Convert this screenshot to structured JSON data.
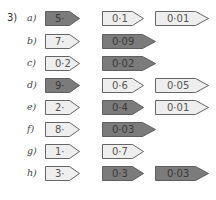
{
  "question": {
    "number": "3)"
  },
  "colors": {
    "dark_fill": "#7b7b7b",
    "light_fill": "#eeeeee",
    "stroke": "#555555"
  },
  "rows": [
    {
      "letter": "a)",
      "tags": [
        {
          "text": "5·",
          "shade": "dark"
        },
        {
          "text": "0·1",
          "shade": "light"
        },
        {
          "text": "0·01",
          "shade": "light"
        }
      ]
    },
    {
      "letter": "b)",
      "tags": [
        {
          "text": "7·",
          "shade": "light"
        },
        {
          "text": "0·09",
          "shade": "dark"
        }
      ]
    },
    {
      "letter": "c)",
      "tags": [
        {
          "text": "0·2",
          "shade": "light"
        },
        {
          "text": "0·02",
          "shade": "dark"
        }
      ]
    },
    {
      "letter": "d)",
      "tags": [
        {
          "text": "9·",
          "shade": "dark"
        },
        {
          "text": "0·6",
          "shade": "light"
        },
        {
          "text": "0·05",
          "shade": "light"
        }
      ]
    },
    {
      "letter": "e)",
      "tags": [
        {
          "text": "2·",
          "shade": "light"
        },
        {
          "text": "0·4",
          "shade": "dark"
        },
        {
          "text": "0·01",
          "shade": "light"
        }
      ]
    },
    {
      "letter": "f)",
      "tags": [
        {
          "text": "8·",
          "shade": "light"
        },
        {
          "text": "0·03",
          "shade": "dark"
        }
      ]
    },
    {
      "letter": "g)",
      "tags": [
        {
          "text": "1·",
          "shade": "light"
        },
        {
          "text": "0·7",
          "shade": "light"
        }
      ]
    },
    {
      "letter": "h)",
      "tags": [
        {
          "text": "3·",
          "shade": "light"
        },
        {
          "text": "0·3",
          "shade": "dark"
        },
        {
          "text": "0·03",
          "shade": "dark"
        }
      ]
    }
  ]
}
